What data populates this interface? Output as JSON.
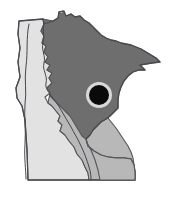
{
  "figure": {
    "type": "choropleth-state-map",
    "background_color": "#ffffff",
    "width": 176,
    "height": 204
  },
  "palette": {
    "dark_gray": "#6e6e6e",
    "medium_gray": "#b8b8b8",
    "light_gray": "#e2e2e2",
    "outline": "#4a4a4f",
    "marker_fill": "#0a0a0a",
    "marker_halo": "#d8d8d8"
  },
  "regions": [
    {
      "id": "northeast-north-central",
      "name": "Northeast / North Central",
      "shade": "dark",
      "color": "#6e6e6e"
    },
    {
      "id": "central-southeast",
      "name": "Central / Southeast",
      "shade": "medium",
      "color": "#b8b8b8"
    },
    {
      "id": "west-southwest",
      "name": "West / Southwest",
      "shade": "light",
      "color": "#e2e2e2"
    }
  ],
  "markers": [
    {
      "id": "location-dot",
      "name": "location-marker",
      "shape": "filled-circle-with-halo",
      "fill": "#0a0a0a",
      "halo": "#d8d8d8",
      "cx": 99,
      "cy": 95,
      "radius": 10,
      "halo_radius": 13
    }
  ],
  "chart_data": {
    "type": "heatmap",
    "xlabel": "",
    "ylabel": "",
    "categories": [
      "Northeast / North Central",
      "Central / Southeast",
      "West / Southwest"
    ],
    "values": [
      3,
      2,
      1
    ],
    "value_labels": [
      "dark",
      "medium",
      "light"
    ],
    "colors": [
      "#6e6e6e",
      "#b8b8b8",
      "#e2e2e2"
    ],
    "legend": [],
    "annotations": [
      {
        "label": "location-marker",
        "x": 99,
        "y": 95,
        "style": "black filled circle with light halo"
      }
    ],
    "grid": false,
    "legend_position": "none"
  }
}
